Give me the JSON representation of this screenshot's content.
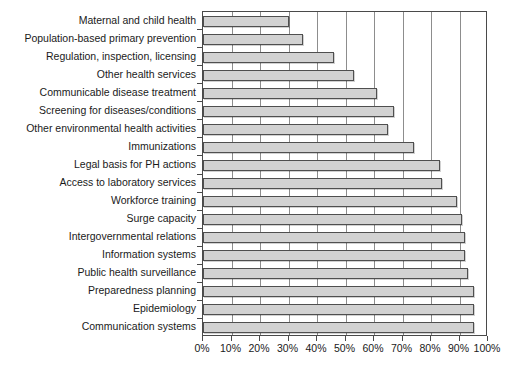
{
  "chart_data": {
    "type": "bar",
    "orientation": "horizontal",
    "title": "",
    "subtitle": "",
    "xlabel": "",
    "ylabel": "",
    "xlim": [
      0,
      100
    ],
    "grid": true,
    "legend": false,
    "tick_labels": [
      "0%",
      "10%",
      "20%",
      "30%",
      "40%",
      "50%",
      "60%",
      "70%",
      "80%",
      "90%",
      "100%"
    ],
    "tick_values": [
      0,
      10,
      20,
      30,
      40,
      50,
      60,
      70,
      80,
      90,
      100
    ],
    "bar_color": "#d2d2d2",
    "bar_border_color": "#4f4f4f",
    "axis_color": "#4a4a4a",
    "categories": [
      "Maternal and child health",
      "Population-based primary prevention",
      "Regulation, inspection, licensing",
      "Other health services",
      "Communicable disease treatment",
      "Screening for diseases/conditions",
      "Other environmental health activities",
      "Immunizations",
      "Legal basis for PH actions",
      "Access to laboratory services",
      "Workforce training",
      "Surge capacity",
      "Intergovernmental relations",
      "Information systems",
      "Public health surveillance",
      "Preparedness planning",
      "Epidemiology",
      "Communication systems"
    ],
    "values": [
      30,
      35,
      46,
      53,
      61,
      67,
      65,
      74,
      83,
      84,
      89,
      91,
      92,
      92,
      93,
      95,
      95,
      95
    ]
  }
}
